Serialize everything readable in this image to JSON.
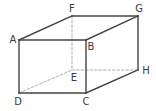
{
  "diagram": {
    "type": "cuboid",
    "colors": {
      "solid_edge": "#444444",
      "hidden_edge": "#a8a8a8",
      "label": "#3a3a3a",
      "background": "#ffffff"
    },
    "vertices": {
      "A": {
        "x": 19,
        "y": 40
      },
      "B": {
        "x": 86,
        "y": 40
      },
      "C": {
        "x": 86,
        "y": 93
      },
      "D": {
        "x": 19,
        "y": 93
      },
      "E": {
        "x": 72,
        "y": 70
      },
      "F": {
        "x": 72,
        "y": 16
      },
      "G": {
        "x": 138,
        "y": 16
      },
      "H": {
        "x": 138,
        "y": 70
      }
    },
    "labels": [
      {
        "text": "A",
        "x": 13,
        "y": 40
      },
      {
        "text": "B",
        "x": 91,
        "y": 47
      },
      {
        "text": "C",
        "x": 86,
        "y": 102
      },
      {
        "text": "D",
        "x": 18,
        "y": 102
      },
      {
        "text": "E",
        "x": 74,
        "y": 78
      },
      {
        "text": "F",
        "x": 72,
        "y": 9
      },
      {
        "text": "G",
        "x": 139,
        "y": 9
      },
      {
        "text": "H",
        "x": 146,
        "y": 71
      }
    ],
    "solid_edges": [
      [
        "A",
        "B"
      ],
      [
        "B",
        "C"
      ],
      [
        "C",
        "D"
      ],
      [
        "D",
        "A"
      ],
      [
        "A",
        "F"
      ],
      [
        "F",
        "G"
      ],
      [
        "B",
        "G"
      ],
      [
        "G",
        "H"
      ],
      [
        "C",
        "H"
      ]
    ],
    "hidden_edges": [
      [
        "F",
        "E"
      ],
      [
        "E",
        "H"
      ],
      [
        "D",
        "E"
      ]
    ]
  }
}
